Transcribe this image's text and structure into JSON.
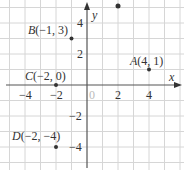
{
  "diagram": {
    "type": "coordinate-plane",
    "axes": {
      "x_label": "x",
      "y_label": "y",
      "origin_label": "0",
      "x_ticks": [
        "−4",
        "−2",
        "2",
        "4"
      ],
      "y_ticks": [
        "4",
        "2",
        "−2",
        "−4"
      ]
    },
    "points": [
      {
        "name": "A",
        "coords": "(4, 1)",
        "x": 4,
        "y": 1
      },
      {
        "name": "B",
        "coords": "(−1, 3)",
        "x": -1,
        "y": 3
      },
      {
        "name": "C",
        "coords": "(−2, 0)",
        "x": -2,
        "y": 0
      },
      {
        "name": "D",
        "coords": "(−2, −4)",
        "x": -2,
        "y": -4
      }
    ],
    "colors": {
      "grid": "#d6d6d6",
      "axis": "#555555",
      "point": "#333333",
      "text": "#333333"
    }
  }
}
